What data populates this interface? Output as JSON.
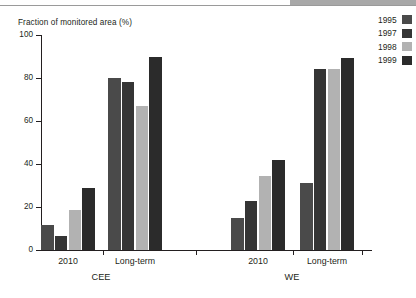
{
  "chart_data": {
    "type": "bar",
    "title": "",
    "subtitle": "",
    "xlabel": "",
    "ylabel": "Fraction of monitored area (%)",
    "ylim": [
      0,
      100
    ],
    "ytick_labels": [
      "0",
      "20",
      "40",
      "60",
      "80",
      "100"
    ],
    "ytick_values": [
      0,
      20,
      40,
      60,
      80,
      100
    ],
    "grid": false,
    "legend_position": "right",
    "categories": [
      "2010",
      "Long-term",
      "2010",
      "Long-term"
    ],
    "region_groups": [
      {
        "name": "CEE",
        "categories": [
          "2010",
          "Long-term"
        ]
      },
      {
        "name": "WE",
        "categories": [
          "2010",
          "Long-term"
        ]
      }
    ],
    "series": [
      {
        "name": "1995",
        "color": "#4a4a4a",
        "values": [
          11.5,
          80.0,
          15.0,
          31.0
        ]
      },
      {
        "name": "1997",
        "color": "#353535",
        "values": [
          6.5,
          78.0,
          23.0,
          84.0
        ]
      },
      {
        "name": "1998",
        "color": "#b2b2b2",
        "values": [
          18.5,
          67.0,
          34.5,
          84.0
        ]
      },
      {
        "name": "1999",
        "color": "#2b2b2b",
        "values": [
          29.0,
          90.0,
          42.0,
          89.5
        ]
      }
    ]
  },
  "axis": {
    "y_title": "Fraction of monitored area (%)",
    "y_ticks": [
      {
        "label": "100",
        "value": 100
      },
      {
        "label": "80",
        "value": 80
      },
      {
        "label": "60",
        "value": 60
      },
      {
        "label": "40",
        "value": 40
      },
      {
        "label": "20",
        "value": 20
      },
      {
        "label": "0",
        "value": 0
      }
    ]
  },
  "groups": [
    {
      "label": "2010"
    },
    {
      "label": "Long-term"
    },
    {
      "label": "2010"
    },
    {
      "label": "Long-term"
    }
  ],
  "regions": [
    {
      "label": "CEE"
    },
    {
      "label": "WE"
    }
  ],
  "legend": {
    "items": [
      {
        "label": "1995",
        "color": "#4a4a4a"
      },
      {
        "label": "1997",
        "color": "#353535"
      },
      {
        "label": "1998",
        "color": "#b2b2b2"
      },
      {
        "label": "1999",
        "color": "#2b2b2b"
      }
    ]
  }
}
